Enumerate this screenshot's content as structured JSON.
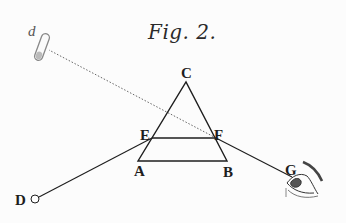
{
  "figure": {
    "title": "Fig. 2.",
    "labels": {
      "A": "A",
      "B": "B",
      "C": "C",
      "D": "D",
      "E": "E",
      "F": "F",
      "G": "G",
      "d": "d"
    },
    "points": {
      "A": [
        138,
        161
      ],
      "B": [
        227,
        161
      ],
      "C": [
        186,
        82
      ],
      "E": [
        152,
        138
      ],
      "F": [
        216,
        138
      ],
      "D": [
        35,
        199
      ],
      "G": [
        292,
        177
      ],
      "d": [
        48,
        49
      ]
    },
    "colors": {
      "ink": "#1e1e1e",
      "faint": "#666666",
      "paper": "#fcfcfc"
    }
  }
}
